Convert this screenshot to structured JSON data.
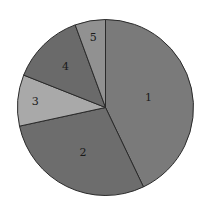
{
  "chart_data": {
    "type": "pie",
    "title": "",
    "categories": [
      "1",
      "2",
      "3",
      "4",
      "5"
    ],
    "values": [
      42.9,
      28.7,
      9.4,
      13.4,
      5.6
    ],
    "colors": [
      "#7a7a7a",
      "#6d6d6d",
      "#a9a9a9",
      "#6a6a6a",
      "#919191"
    ],
    "start_angle_deg": 0,
    "direction": "clockwise",
    "legend": "none",
    "labels_inside": true
  },
  "layout": {
    "cx": 105.5,
    "cy": 107.5,
    "r": 88,
    "label_radius_frac": [
      0.5,
      0.58,
      0.8,
      0.65,
      0.8
    ]
  }
}
